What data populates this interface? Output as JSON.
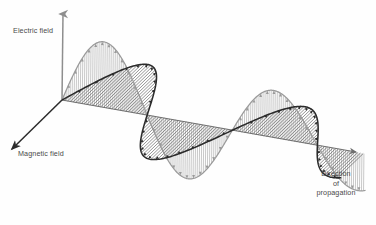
{
  "figure": {
    "background_color": "#fefefe"
  },
  "labels": {
    "electric_field": "Electric field",
    "magnetic_field": "Magnetic field",
    "direction_line1": "Direction",
    "direction_line2": "of",
    "direction_line3": "propagation"
  },
  "colors": {
    "electric_curve": "#9a9a9a",
    "magnetic_curve": "#2b2b2b",
    "axis_vertical": "#8e8e8e",
    "axis_propagation": "#6f6f6f",
    "axis_magnetic": "#2b2b2b",
    "hatch_electric": "#a8a8a8",
    "hatch_magnetic": "#555555",
    "text": "#4a4a4a",
    "background": "#fefefe"
  },
  "chart_data": {
    "type": "line",
    "xlabel": "Direction of propagation",
    "ylabel": "Electric field",
    "zlabel": "Magnetic field",
    "legend_position": "inline-annotations",
    "grid": false,
    "annotations": [
      "Electric field",
      "Magnetic field",
      "Direction of propagation"
    ],
    "axes": {
      "origin_px": [
        62,
        100
      ],
      "electric_axis_tip_px": [
        63,
        10
      ],
      "magnetic_axis_tip_px": [
        8,
        152
      ],
      "propagation_axis_tip_px": [
        360,
        153
      ]
    },
    "series": [
      {
        "name": "Electric field",
        "plane": "vertical",
        "color": "#9a9a9a",
        "cycles": 1.75,
        "phase_deg": 0,
        "hatch": "vertical",
        "arrow_direction": "along-field-vector",
        "x": [
          0,
          0.125,
          0.25,
          0.375,
          0.5,
          0.625,
          0.75,
          0.875,
          1.0,
          1.125,
          1.25,
          1.375,
          1.5,
          1.625,
          1.75
        ],
        "values": [
          0,
          0.707,
          1.0,
          0.707,
          0,
          -0.707,
          -1.0,
          -0.707,
          0,
          0.707,
          1.0,
          0.707,
          0,
          -0.707,
          -1.0
        ]
      },
      {
        "name": "Magnetic field",
        "plane": "horizontal",
        "color": "#2b2b2b",
        "cycles": 1.75,
        "phase_deg": 180,
        "hatch": "diagonal",
        "arrow_direction": "along-field-vector",
        "x": [
          0,
          0.125,
          0.25,
          0.375,
          0.5,
          0.625,
          0.75,
          0.875,
          1.0,
          1.125,
          1.25,
          1.375,
          1.5,
          1.625,
          1.75
        ],
        "values": [
          0,
          -0.707,
          -1.0,
          -0.707,
          0,
          0.707,
          1.0,
          0.707,
          0,
          -0.707,
          -1.0,
          -0.707,
          0,
          0.707,
          1.0
        ]
      }
    ],
    "xlim": [
      0,
      1.75
    ],
    "ylim": [
      -1,
      1
    ]
  }
}
